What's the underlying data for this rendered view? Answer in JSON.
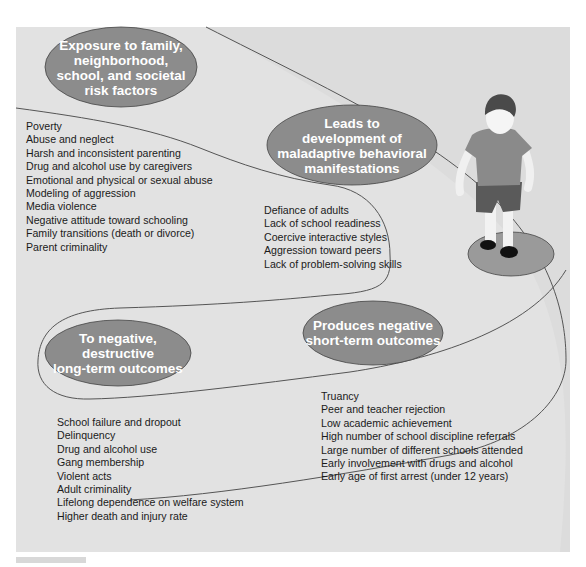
{
  "colors": {
    "background": "#e2e2e2",
    "bubble_fill": "#8c8c8c",
    "bubble_text": "#ffffff",
    "outline": "#555555",
    "text": "#1a1a1a"
  },
  "stages": [
    {
      "id": "risk-factors",
      "title": "Exposure to family,\nneighborhood,\nschool, and societal\nrisk factors",
      "items": [
        "Poverty",
        "Abuse and neglect",
        "Harsh and inconsistent parenting",
        "Drug and alcohol use by caregivers",
        "Emotional and physical or sexual abuse",
        "Modeling of aggression",
        "Media violence",
        "Negative attitude toward schooling",
        "Family transitions (death or divorce)",
        "Parent criminality"
      ]
    },
    {
      "id": "maladaptive",
      "title": "Leads to\ndevelopment of\nmaladaptive behavioral\nmanifestations",
      "items": [
        "Defiance of adults",
        "Lack of school readiness",
        "Coercive interactive styles",
        "Aggression toward peers",
        "Lack of problem-solving skills"
      ]
    },
    {
      "id": "short-term",
      "title": "Produces negative\nshort-term outcomes",
      "items": [
        "Truancy",
        "Peer and teacher rejection",
        "Low academic achievement",
        "High number of school discipline referrals",
        "Large number of different schools attended",
        "Early involvement with drugs and alcohol",
        "Early age of first arrest (under 12 years)"
      ]
    },
    {
      "id": "long-term",
      "title": "To negative, destructive\nlong-term outcomes",
      "items": [
        "School failure and dropout",
        "Delinquency",
        "Drug and alcohol use",
        "Gang membership",
        "Violent acts",
        "Adult criminality",
        "Lifelong dependence on welfare system",
        "Higher death and injury rate"
      ]
    }
  ],
  "illustration": {
    "subject": "child-walking-icon"
  }
}
